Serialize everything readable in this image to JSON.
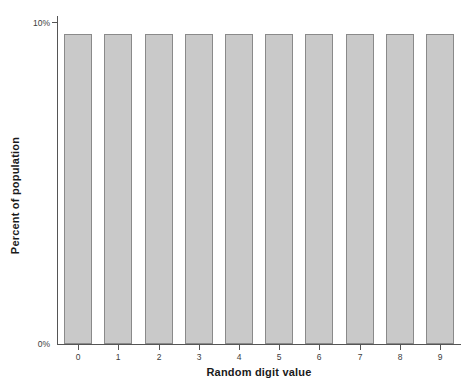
{
  "chart_data": {
    "type": "bar",
    "title": "",
    "subtitle": "",
    "xlabel": "Random digit value",
    "ylabel": "Percent of population",
    "categories": [
      "0",
      "1",
      "2",
      "3",
      "4",
      "5",
      "6",
      "7",
      "8",
      "9"
    ],
    "values": [
      10,
      10,
      10,
      10,
      10,
      10,
      10,
      10,
      10,
      10
    ],
    "series": [
      {
        "name": "Percent of population",
        "values": [
          10,
          10,
          10,
          10,
          10,
          10,
          10,
          10,
          10,
          10
        ]
      }
    ],
    "ylim": [
      0,
      10.4
    ],
    "ytick_values": [
      0,
      10
    ],
    "ytick_labels": [
      "0%",
      "10%"
    ],
    "xtick_labels": [
      "0",
      "1",
      "2",
      "3",
      "4",
      "5",
      "6",
      "7",
      "8",
      "9"
    ],
    "grid": false,
    "legend": false,
    "legend_position": "none",
    "annotations": [],
    "colors": {
      "bar_fill": "#c9c9c9",
      "bar_border": "#8a8a8a",
      "axis": "#555555",
      "tick_label": "#3c3c3c",
      "axis_title": "#1a1a1a",
      "background": "#ffffff"
    }
  }
}
